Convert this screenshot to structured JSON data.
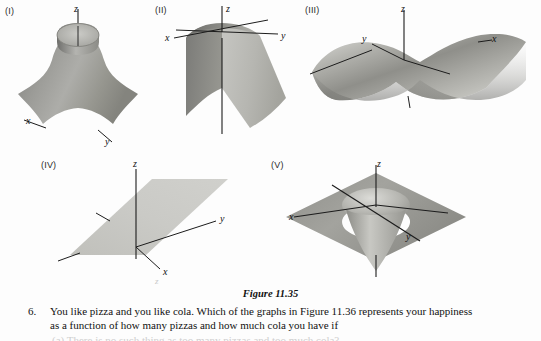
{
  "figure": {
    "caption": "Figure 11.35",
    "panels": [
      {
        "id": "I",
        "label": "(I)",
        "surface_name": "cone-bowl-surface",
        "description": "Surface rising steeply to a cylindrical throat around the z-axis",
        "axes": {
          "z": "z",
          "x": "x",
          "y": "y"
        }
      },
      {
        "id": "II",
        "label": "(II)",
        "surface_name": "arch-ridge-surface",
        "description": "Arch or ridge surface, concave downward along one direction",
        "axes": {
          "z": "z",
          "x": "x",
          "y": "y"
        }
      },
      {
        "id": "III",
        "label": "(III)",
        "surface_name": "saddle-surface",
        "description": "Hyperbolic paraboloid saddle surface",
        "axes": {
          "z": "z",
          "x": "x",
          "y": "y"
        }
      },
      {
        "id": "IV",
        "label": "(IV)",
        "surface_name": "tilted-plane-surface",
        "description": "Flat tilted plane through the origin",
        "axes": {
          "z": "z",
          "x": "x",
          "y": "y"
        }
      },
      {
        "id": "V",
        "label": "(V)",
        "surface_name": "funnel-surface",
        "description": "Flat sheet with a downward funnel at the origin",
        "axes": {
          "z": "z",
          "x": "x",
          "y": "y"
        }
      }
    ]
  },
  "problem": {
    "number": "6.",
    "line1": "You like pizza and you like cola. Which of the graphs in Figure 11.36 represents your happiness",
    "line2": "as a function of how many pizzas and how much cola you have if"
  },
  "artifacts": {
    "stray_glyph": "z",
    "cut_line": "(a)  There is no such thing as too many pizzas and too much cola?"
  },
  "colors": {
    "surface_dark": "#8b8b88",
    "surface_mid": "#a2a29e",
    "surface_light": "#c6c6c2",
    "axis": "#1c1c1c",
    "text": "#111111",
    "page": "#fdfdfd"
  }
}
